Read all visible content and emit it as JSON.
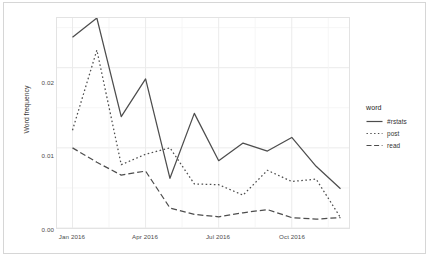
{
  "chart_data": {
    "type": "line",
    "title": "",
    "xlabel": "",
    "ylabel": "Word frequency",
    "ylim": [
      0.0,
      0.0262
    ],
    "xlim": [
      "2016-01",
      "2016-12"
    ],
    "grid": true,
    "legend_position": "right",
    "legend_title": "word",
    "y_ticks": [
      "0.00",
      "0.01",
      "0.02"
    ],
    "y_tick_values": [
      0.0,
      0.01,
      0.02
    ],
    "x_ticks": [
      "Jan 2016",
      "Apr 2016",
      "Jul 2016",
      "Oct 2016"
    ],
    "x_tick_values": [
      "2016-01",
      "2016-04",
      "2016-07",
      "2016-10"
    ],
    "x": [
      "2016-01",
      "2016-02",
      "2016-03",
      "2016-04",
      "2016-05",
      "2016-06",
      "2016-07",
      "2016-08",
      "2016-09",
      "2016-10",
      "2016-11",
      "2016-12"
    ],
    "categories": [
      "Jan 2016",
      "Feb 2016",
      "Mar 2016",
      "Apr 2016",
      "May 2016",
      "Jun 2016",
      "Jul 2016",
      "Aug 2016",
      "Sep 2016",
      "Oct 2016",
      "Nov 2016",
      "Dec 2016"
    ],
    "series": [
      {
        "name": "#rstats",
        "linestyle": "solid",
        "color": "#4d4d4d",
        "values": [
          0.0238,
          0.0262,
          0.0139,
          0.0186,
          0.0062,
          0.0143,
          0.0084,
          0.0106,
          0.0096,
          0.0113,
          0.0077,
          0.0049
        ]
      },
      {
        "name": "post",
        "linestyle": "dotted",
        "color": "#4d4d4d",
        "values": [
          0.0122,
          0.0222,
          0.0079,
          0.0092,
          0.01,
          0.0055,
          0.0054,
          0.0041,
          0.0072,
          0.0058,
          0.0061,
          0.0013
        ]
      },
      {
        "name": "read",
        "linestyle": "dashed",
        "color": "#4d4d4d",
        "values": [
          0.01,
          0.0082,
          0.0066,
          0.0071,
          0.0025,
          0.0017,
          0.0014,
          0.0019,
          0.0023,
          0.0013,
          0.0011,
          0.0013
        ]
      }
    ]
  },
  "legend": {
    "title": "word",
    "entries": [
      {
        "label": "#rstats",
        "style": "solid"
      },
      {
        "label": "post",
        "style": "dotted"
      },
      {
        "label": "read",
        "style": "dashed"
      }
    ]
  },
  "axes": {
    "y_title": "Word frequency",
    "y_ticks": [
      "0.02",
      "0.01",
      "0.00"
    ],
    "x_ticks": [
      "Jan 2016",
      "Apr 2016",
      "Jul 2016",
      "Oct 2016"
    ]
  }
}
